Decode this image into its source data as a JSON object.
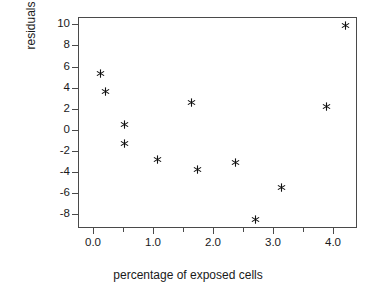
{
  "chart_data": {
    "type": "scatter",
    "title": "",
    "xlabel": "percentage of exposed cells",
    "ylabel": "residuals",
    "xlim": [
      -0.25,
      4.4
    ],
    "ylim": [
      -9.3,
      10.7
    ],
    "grid": false,
    "legend": null,
    "marker_style": "asterisk",
    "marker_color": "#111111",
    "xticks": [
      0.0,
      1.0,
      2.0,
      3.0,
      4.0
    ],
    "xtick_labels": [
      "0.0",
      "1.0",
      "2.0",
      "3.0",
      "4.0"
    ],
    "xticks_minor": [
      0.5,
      1.5,
      2.5,
      3.5
    ],
    "yticks": [
      10,
      8,
      6,
      4,
      2,
      0,
      -2,
      -4,
      -6,
      -8
    ],
    "ytick_labels": [
      "10",
      "8",
      "6",
      "4",
      "2",
      "0",
      "-2",
      "-4",
      "-6",
      "-8"
    ],
    "points": [
      {
        "x": 0.12,
        "y": 5.3
      },
      {
        "x": 0.2,
        "y": 3.65
      },
      {
        "x": 0.52,
        "y": 0.5
      },
      {
        "x": 0.53,
        "y": -1.3
      },
      {
        "x": 1.08,
        "y": -2.8
      },
      {
        "x": 1.64,
        "y": 2.55
      },
      {
        "x": 1.74,
        "y": -3.75
      },
      {
        "x": 2.38,
        "y": -3.1
      },
      {
        "x": 2.71,
        "y": -8.5
      },
      {
        "x": 3.14,
        "y": -5.45
      },
      {
        "x": 3.89,
        "y": 2.25
      },
      {
        "x": 4.2,
        "y": 9.9
      }
    ]
  },
  "axes": {
    "x_title": "percentage of exposed cells",
    "y_title": "residuals"
  },
  "colors": {
    "frame": "#4a4a4a",
    "marker": "#111111",
    "text": "#1a1a1a",
    "background": "#ffffff"
  }
}
